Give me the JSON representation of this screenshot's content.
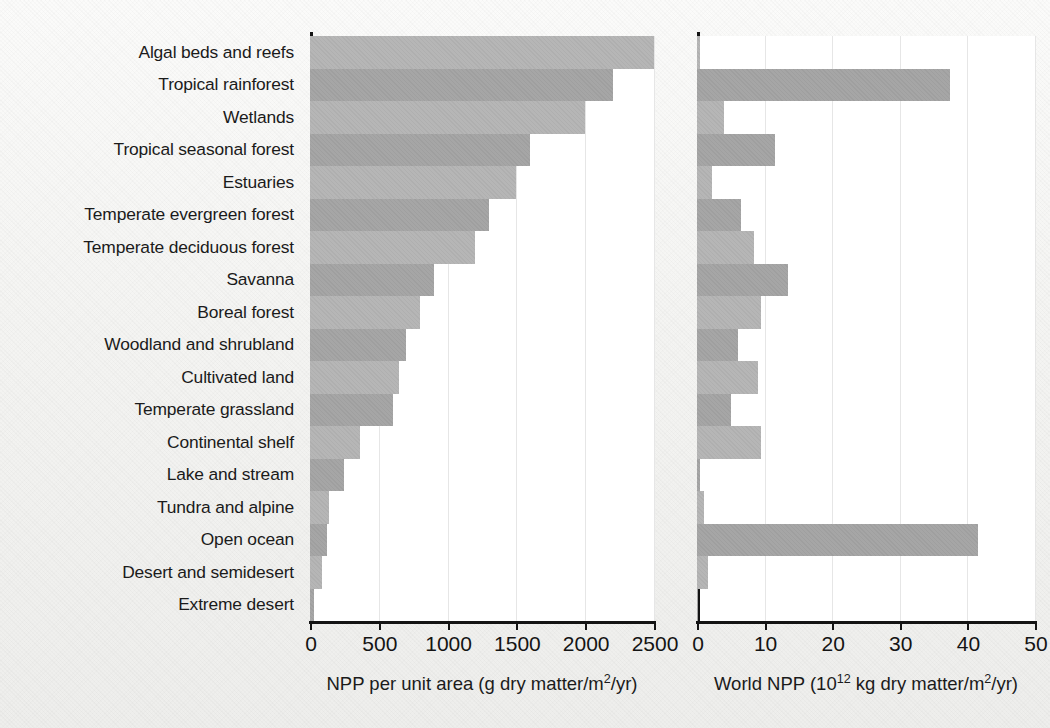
{
  "chart_data": {
    "type": "bar",
    "title": "",
    "orientation": "horizontal",
    "categories": [
      "Algal beds and reefs",
      "Tropical rainforest",
      "Wetlands",
      "Tropical seasonal forest",
      "Estuaries",
      "Temperate evergreen forest",
      "Temperate deciduous forest",
      "Savanna",
      "Boreal forest",
      "Woodland and shrubland",
      "Cultivated land",
      "Temperate grassland",
      "Continental shelf",
      "Lake and stream",
      "Tundra and alpine",
      "Open ocean",
      "Desert and semidesert",
      "Extreme desert"
    ],
    "panels": [
      {
        "id": "npp-per-unit-area",
        "xlabel_plain": "NPP per unit area (g dry matter/m2/yr)",
        "xlabel_pre": "NPP per unit area (g dry matter/m",
        "xlabel_sup": "2",
        "xlabel_post": "/yr)",
        "xlim": [
          0,
          2500
        ],
        "xticks": [
          0,
          500,
          1000,
          1500,
          2000,
          2500
        ],
        "xticklabels": [
          "0",
          "500",
          "1000",
          "1500",
          "2000",
          "2500"
        ],
        "values": [
          2500,
          2200,
          2000,
          1600,
          1500,
          1300,
          1200,
          900,
          800,
          700,
          650,
          600,
          360,
          250,
          140,
          125,
          90,
          30
        ]
      },
      {
        "id": "world-npp",
        "xlabel_plain": "World NPP (1012 kg dry matter/m2/yr)",
        "xlabel_pre": "World NPP (10",
        "xlabel_sup": "12",
        "xlabel_mid": " kg dry matter/m",
        "xlabel_sup2": "2",
        "xlabel_post": "/yr)",
        "xlim": [
          0,
          50
        ],
        "xticks": [
          0,
          10,
          20,
          30,
          40,
          50
        ],
        "xticklabels": [
          "0",
          "10",
          "20",
          "30",
          "40",
          "50"
        ],
        "values": [
          0.5,
          37.4,
          4.0,
          11.5,
          2.2,
          6.5,
          8.5,
          13.5,
          9.5,
          6.0,
          9.0,
          5.0,
          9.5,
          0.5,
          1.1,
          41.5,
          1.6,
          0.07
        ]
      }
    ],
    "grid": "vertical-light",
    "legend": "none",
    "bar_color": "#b4b4b4",
    "bar_color_alt": "#a3a3a3",
    "axis_color": "#141414",
    "background": "#f4f4f2"
  }
}
